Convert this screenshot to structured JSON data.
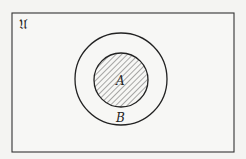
{
  "diagram": {
    "type": "venn",
    "universe_label": "𝔘",
    "sets": [
      {
        "name": "A",
        "label": "A",
        "shaded": true,
        "subset_of": "B"
      },
      {
        "name": "B",
        "label": "B",
        "shaded": false
      }
    ],
    "colors": {
      "stroke": "#222222",
      "background": "#f4f4f2",
      "hatch": "#444444"
    }
  }
}
